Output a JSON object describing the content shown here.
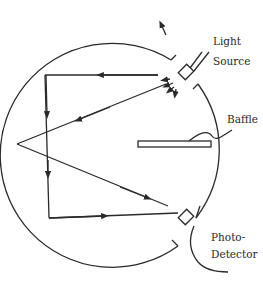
{
  "diagram": {
    "type": "integrating-sphere",
    "labels": {
      "light_source_line1": "Light",
      "light_source_line2": "Source",
      "baffle": "Baffle",
      "photodetector_line1": "Photo-",
      "photodetector_line2": "Detector"
    },
    "components": [
      {
        "name": "sphere",
        "shape": "circle"
      },
      {
        "name": "light-source",
        "port": "upper-right"
      },
      {
        "name": "baffle",
        "shape": "rectangle",
        "position": "right-middle"
      },
      {
        "name": "photodetector",
        "port": "lower-right"
      }
    ],
    "colors": {
      "stroke": "#2a2a2a",
      "background": "#ffffff"
    }
  }
}
